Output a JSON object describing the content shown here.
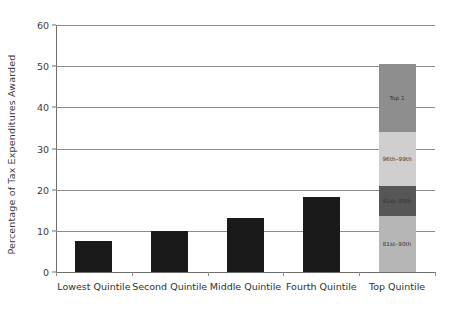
{
  "chart_data": {
    "type": "bar",
    "title": "",
    "xlabel": "",
    "ylabel": "Percentage of Tax Expenditures Awarded",
    "ylim": [
      0,
      60
    ],
    "ytick_labels": [
      "0",
      "10",
      "20",
      "30",
      "40",
      "50",
      "60"
    ],
    "ytick_values": [
      0,
      10,
      20,
      30,
      40,
      50,
      60
    ],
    "grid": true,
    "legend": "none",
    "categories": [
      "Lowest Quintile",
      "Second Quintile",
      "Middle Quintile",
      "Fourth Quintile",
      "Top Quintile"
    ],
    "values": [
      7.5,
      10.0,
      13.2,
      18.2,
      50.5
    ],
    "bars": [
      {
        "category": "Lowest Quintile",
        "total": 7.5,
        "stacked": false,
        "segments": [
          {
            "label": "",
            "value": 7.5,
            "color": "#1a1a1a"
          }
        ]
      },
      {
        "category": "Second Quintile",
        "total": 10.0,
        "stacked": false,
        "segments": [
          {
            "label": "",
            "value": 10.0,
            "color": "#1a1a1a"
          }
        ]
      },
      {
        "category": "Middle Quintile",
        "total": 13.2,
        "stacked": false,
        "segments": [
          {
            "label": "",
            "value": 13.2,
            "color": "#1a1a1a"
          }
        ]
      },
      {
        "category": "Fourth Quintile",
        "total": 18.2,
        "stacked": false,
        "segments": [
          {
            "label": "",
            "value": 18.2,
            "color": "#1a1a1a"
          }
        ]
      },
      {
        "category": "Top Quintile",
        "total": 50.5,
        "stacked": true,
        "segments": [
          {
            "label": "Top 1",
            "value": 16.5,
            "color": "#8e8e8e"
          },
          {
            "label": "96th–99th",
            "value": 13.0,
            "color": "#cfcfcf"
          },
          {
            "label": "91st–95th",
            "value": 7.5,
            "color": "#565656"
          },
          {
            "label": "81st–90th",
            "value": 13.5,
            "color": "#b6b6b6"
          }
        ]
      }
    ]
  }
}
